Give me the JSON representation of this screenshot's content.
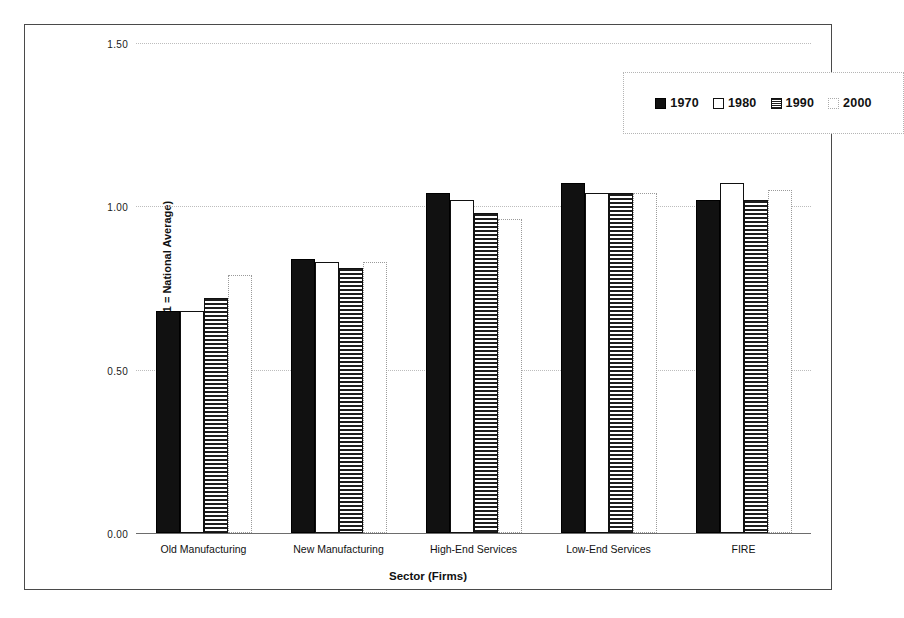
{
  "chart_data": {
    "type": "bar",
    "title": "",
    "subtitle": "",
    "xlabel": "Sector (Firms)",
    "ylabel": "Location Quotient (1 = National Average)",
    "categories": [
      "Old Manufacturing",
      "New Manufacturing",
      "High-End Services",
      "Low-End Services",
      "FIRE"
    ],
    "series": [
      {
        "name": "1970",
        "pattern": "solid-black",
        "values": [
          0.68,
          0.84,
          1.04,
          1.07,
          1.02
        ]
      },
      {
        "name": "1980",
        "pattern": "white-outline",
        "values": [
          0.68,
          0.83,
          1.02,
          1.04,
          1.07
        ]
      },
      {
        "name": "1990",
        "pattern": "horizontal-hatch",
        "values": [
          0.72,
          0.81,
          0.98,
          1.04,
          1.02
        ]
      },
      {
        "name": "2000",
        "pattern": "light-dotted-outline",
        "values": [
          0.79,
          0.83,
          0.96,
          1.04,
          1.05
        ]
      }
    ],
    "ylim": [
      0.0,
      1.5
    ],
    "yticks": [
      0.0,
      0.5,
      1.0,
      1.5
    ],
    "ytick_labels": [
      "0.00",
      "0.50",
      "1.00",
      "1.50"
    ],
    "grid": "horizontal-dotted",
    "legend_position": "top-right",
    "legend_entries": [
      "1970",
      "1980",
      "1990",
      "2000"
    ],
    "colors": {
      "series_1970": "#111111",
      "series_1980": "#ffffff",
      "series_1990": "#1d1d1d",
      "series_2000": "#ffffff",
      "axis": "#6d6d6d",
      "gridline": "#bdbdbd",
      "frame": "#4a4a4a",
      "text": "#111111"
    }
  }
}
